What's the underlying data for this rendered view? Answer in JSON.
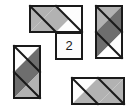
{
  "figure": {
    "canvas": {
      "width": 135,
      "height": 112,
      "background": "#ffffff"
    },
    "palette": {
      "light_gray": "#b2b2b2",
      "dark_gray": "#6e6e6e",
      "white": "#fdfdfd",
      "outline": "#1a1a1a"
    },
    "unit_cell_size": 26,
    "labels": [
      {
        "id": "cell-label-2",
        "text": "2",
        "x": 69,
        "y": 46
      }
    ],
    "pieces": [
      {
        "id": "piece-top-horizontal-domino",
        "name": "top-horizontal-domino",
        "shape": "domino-horizontal",
        "x": 30,
        "y": 6,
        "cols": 2,
        "rows": 1,
        "cells": [
          {
            "col": 0,
            "row": 0,
            "diagonal": "nw-se",
            "upper_fill": "light_gray",
            "lower_fill": "light_gray"
          },
          {
            "col": 1,
            "row": 0,
            "diagonal": "nw-se",
            "upper_fill": "light_gray",
            "lower_fill": "white"
          }
        ]
      },
      {
        "id": "piece-top-right-vertical-domino",
        "name": "top-right-vertical-domino",
        "shape": "domino-vertical",
        "x": 96,
        "y": 6,
        "cols": 1,
        "rows": 2,
        "cells": [
          {
            "col": 0,
            "row": 0,
            "diagonal": "nw-se",
            "upper_fill": "light_gray",
            "lower_fill": "dark_gray"
          },
          {
            "col": 0,
            "row": 1,
            "diagonal": "nw-se",
            "upper_fill": "dark_gray",
            "lower_fill": "white"
          }
        ]
      },
      {
        "id": "piece-center-square",
        "name": "center-labeled-square",
        "shape": "unit-square",
        "x": 56,
        "y": 33,
        "cols": 1,
        "rows": 1,
        "label": "2",
        "cells": [
          {
            "col": 0,
            "row": 0,
            "diagonal": "none",
            "upper_fill": "white",
            "lower_fill": "white"
          }
        ]
      },
      {
        "id": "piece-left-vertical-domino",
        "name": "left-vertical-domino",
        "shape": "domino-vertical",
        "x": 14,
        "y": 46,
        "cols": 1,
        "rows": 2,
        "cells": [
          {
            "col": 0,
            "row": 0,
            "diagonal": "nw-se",
            "upper_fill": "white",
            "lower_fill": "dark_gray"
          },
          {
            "col": 0,
            "row": 1,
            "diagonal": "nw-se",
            "upper_fill": "dark_gray",
            "lower_fill": "light_gray"
          }
        ]
      },
      {
        "id": "piece-bottom-horizontal-domino",
        "name": "bottom-horizontal-domino",
        "shape": "domino-horizontal",
        "x": 72,
        "y": 78,
        "cols": 2,
        "rows": 1,
        "cells": [
          {
            "col": 0,
            "row": 0,
            "diagonal": "nw-se",
            "upper_fill": "white",
            "lower_fill": "light_gray"
          },
          {
            "col": 1,
            "row": 0,
            "diagonal": "nw-se",
            "upper_fill": "light_gray",
            "lower_fill": "light_gray"
          }
        ]
      }
    ]
  }
}
